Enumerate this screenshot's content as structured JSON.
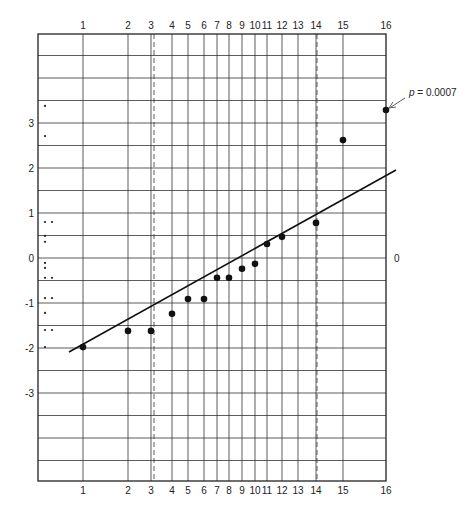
{
  "chart_data": {
    "type": "scatter",
    "title": "",
    "xlabel": "",
    "ylabel": "",
    "grid": true,
    "x_tick_labels": [
      "1",
      "2",
      "3",
      "4",
      "5",
      "6",
      "7",
      "8",
      "9",
      "10",
      "11",
      "12",
      "13",
      "14",
      "15",
      "16"
    ],
    "x_tick_px": [
      83,
      128,
      151,
      172,
      188,
      204,
      217,
      229,
      242,
      255,
      267,
      282,
      298,
      316,
      343,
      386
    ],
    "dashed_verticals": [
      {
        "at": "3",
        "px": 154
      },
      {
        "at": "14",
        "px": 317
      }
    ],
    "y_tick_labels": [
      "3",
      "2",
      "1",
      "0",
      "-1",
      "-2",
      "-3"
    ],
    "y_tick_values": [
      3,
      2,
      1,
      0,
      -1,
      -2,
      -3
    ],
    "right_axis_label": "0",
    "ylim": [
      -4.96,
      4.98
    ],
    "y_zero_px": 258,
    "px_per_unit": 45,
    "series": [
      {
        "name": "ordered observations",
        "x": [
          1,
          2,
          3,
          4,
          5,
          6,
          7,
          8,
          9,
          10,
          11,
          12,
          14,
          15,
          16
        ],
        "values": [
          -1.98,
          -1.62,
          -1.62,
          -1.24,
          -0.91,
          -0.91,
          -0.44,
          -0.44,
          -0.24,
          -0.13,
          0.31,
          0.47,
          0.78,
          2.62,
          3.29
        ]
      },
      {
        "name": "marginal dot plot",
        "values": [
          3.38,
          2.71,
          0.8,
          0.8,
          0.49,
          0.36,
          -0.11,
          -0.22,
          -0.44,
          -0.44,
          -0.89,
          -0.89,
          -1.22,
          -1.6,
          -1.6,
          -1.98
        ]
      }
    ],
    "fit_line": {
      "x1_px": 69,
      "y1_px": 352,
      "x2_px": 396,
      "y2_px": 170
    },
    "annotation": {
      "text_prefix": "p",
      "text_suffix": " = 0.0007",
      "target": "point 16"
    }
  }
}
